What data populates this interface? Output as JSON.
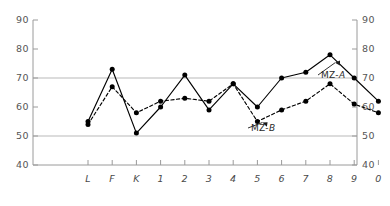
{
  "chart_data": {
    "type": "line",
    "title": "",
    "subtitle": "",
    "xlabel": "",
    "ylabel": "",
    "categories": [
      "L",
      "F",
      "K",
      "1",
      "2",
      "3",
      "4",
      "5",
      "6",
      "7",
      "8",
      "9",
      "0"
    ],
    "ylim": [
      40,
      90
    ],
    "ytick_labels": [
      "40",
      "50",
      "60",
      "70",
      "80",
      "90"
    ],
    "ytick_values": [
      40,
      50,
      60,
      70,
      80,
      90
    ],
    "ytick_labels_right": [
      "40",
      "50",
      "60",
      "70",
      "80",
      "90"
    ],
    "grid": true,
    "gridlines": [
      50,
      70
    ],
    "legend_position": "inline-annotation",
    "series": [
      {
        "name": "MZ-A",
        "style": "solid",
        "marker": "filled-circle",
        "color": "#000000",
        "values": [
          55,
          73,
          51,
          60,
          71,
          59,
          68,
          60,
          70,
          72,
          78,
          70,
          62
        ]
      },
      {
        "name": "MZ-B",
        "style": "dashed",
        "marker": "filled-circle",
        "color": "#000000",
        "values": [
          54,
          67,
          58,
          62,
          63,
          62,
          68,
          55,
          59,
          62,
          68,
          61,
          58
        ]
      }
    ],
    "annotations": [
      {
        "text": "MZ-A",
        "series": "MZ-A",
        "anchor_category": "8"
      },
      {
        "text": "MZ-B",
        "series": "MZ-B",
        "anchor_category": "5"
      }
    ],
    "axis_color": "#9a9a9a",
    "grid_color": "#b9b9b9",
    "line_color": "#000000"
  },
  "annotation_labels": {
    "mz_a_prefix": "MZ-",
    "mz_a_suffix": "A",
    "mz_b_prefix": "MZ-",
    "mz_b_suffix": "B"
  }
}
